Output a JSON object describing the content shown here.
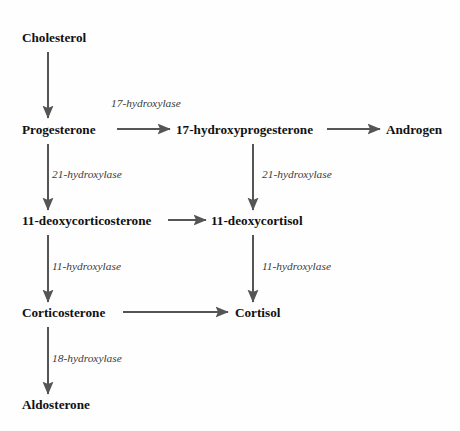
{
  "diagram": {
    "type": "flow-diagram",
    "background_color": "#fefefe",
    "line_color": "#555555",
    "node_text_color": "#111111",
    "enzyme_text_color": "#3b3b3b",
    "nodes": [
      {
        "id": "cholesterol",
        "label": "Cholesterol",
        "x": 22,
        "y": 42
      },
      {
        "id": "progesterone",
        "label": "Progesterone",
        "x": 22,
        "y": 134
      },
      {
        "id": "hydroxyprogesterone",
        "label": "17-hydroxyprogesterone",
        "x": 176,
        "y": 134
      },
      {
        "id": "androgen",
        "label": "Androgen",
        "x": 386,
        "y": 134
      },
      {
        "id": "deoxycorticosterone",
        "label": "11-deoxycorticosterone",
        "x": 22,
        "y": 225
      },
      {
        "id": "deoxycortisol",
        "label": "11-deoxycortisol",
        "x": 211,
        "y": 225
      },
      {
        "id": "corticosterone",
        "label": "Corticosterone",
        "x": 22,
        "y": 317
      },
      {
        "id": "cortisol",
        "label": "Cortisol",
        "x": 235,
        "y": 317
      },
      {
        "id": "aldosterone",
        "label": "Aldosterone",
        "x": 22,
        "y": 409
      }
    ],
    "enzymes": [
      {
        "id": "enz-17-hydroxylase",
        "label": "17-hydroxylase",
        "x": 111,
        "y": 107
      },
      {
        "id": "enz-21-hydroxylase-left",
        "label": "21-hydroxylase",
        "x": 52,
        "y": 178
      },
      {
        "id": "enz-21-hydroxylase-right",
        "label": "21-hydroxylase",
        "x": 262,
        "y": 178
      },
      {
        "id": "enz-11-hydroxylase-left",
        "label": "11-hydroxylase",
        "x": 52,
        "y": 270
      },
      {
        "id": "enz-11-hydroxylase-right",
        "label": "11-hydroxylase",
        "x": 262,
        "y": 270
      },
      {
        "id": "enz-18-hydroxylase",
        "label": "18-hydroxylase",
        "x": 52,
        "y": 362
      }
    ],
    "arrows": [
      {
        "id": "arrow-cholesterol-to-progesterone",
        "from": "cholesterol",
        "to": "progesterone",
        "orientation": "vertical",
        "x1": 48,
        "y1": 52,
        "x2": 48,
        "y2": 118
      },
      {
        "id": "arrow-progesterone-to-hydroxyprogesterone",
        "from": "progesterone",
        "to": "hydroxyprogesterone",
        "orientation": "horizontal",
        "x1": 117,
        "y1": 129,
        "x2": 170,
        "y2": 129
      },
      {
        "id": "arrow-hydroxyprogesterone-to-androgen",
        "from": "hydroxyprogesterone",
        "to": "androgen",
        "orientation": "horizontal",
        "x1": 327,
        "y1": 129,
        "x2": 380,
        "y2": 129
      },
      {
        "id": "arrow-progesterone-to-deoxycorticosterone",
        "from": "progesterone",
        "to": "deoxycorticosterone",
        "orientation": "vertical",
        "x1": 48,
        "y1": 144,
        "x2": 48,
        "y2": 210
      },
      {
        "id": "arrow-hydroxyprogesterone-to-deoxycortisol",
        "from": "hydroxyprogesterone",
        "to": "deoxycortisol",
        "orientation": "vertical",
        "x1": 253,
        "y1": 144,
        "x2": 253,
        "y2": 210
      },
      {
        "id": "arrow-deoxycorticosterone-to-deoxycortisol",
        "from": "deoxycorticosterone",
        "to": "deoxycortisol",
        "orientation": "horizontal",
        "x1": 168,
        "y1": 220,
        "x2": 206,
        "y2": 220
      },
      {
        "id": "arrow-deoxycorticosterone-to-corticosterone",
        "from": "deoxycorticosterone",
        "to": "corticosterone",
        "orientation": "vertical",
        "x1": 48,
        "y1": 235,
        "x2": 48,
        "y2": 302
      },
      {
        "id": "arrow-deoxycortisol-to-cortisol",
        "from": "deoxycortisol",
        "to": "cortisol",
        "orientation": "vertical",
        "x1": 253,
        "y1": 235,
        "x2": 253,
        "y2": 302
      },
      {
        "id": "arrow-corticosterone-to-cortisol",
        "from": "corticosterone",
        "to": "cortisol",
        "orientation": "horizontal",
        "x1": 123,
        "y1": 312,
        "x2": 228,
        "y2": 312
      },
      {
        "id": "arrow-corticosterone-to-aldosterone",
        "from": "corticosterone",
        "to": "aldosterone",
        "orientation": "vertical",
        "x1": 48,
        "y1": 327,
        "x2": 48,
        "y2": 394
      }
    ]
  }
}
